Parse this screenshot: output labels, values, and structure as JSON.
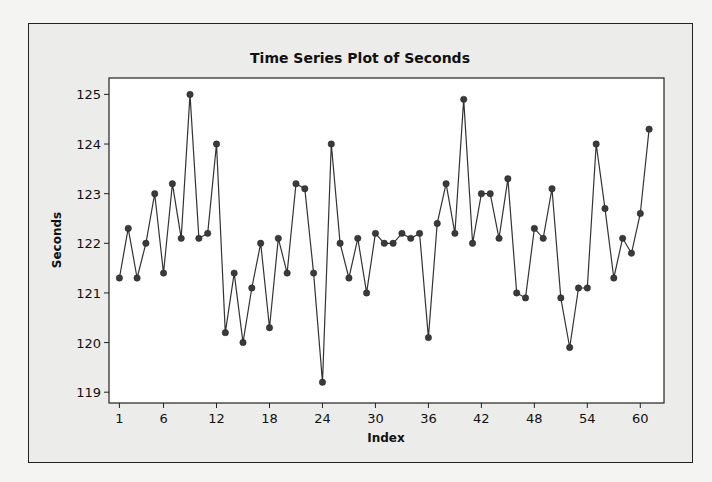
{
  "chart_data": {
    "type": "line",
    "title": "Time Series Plot of Seconds",
    "xlabel": "Index",
    "ylabel": "Seconds",
    "x_ticks": [
      1,
      6,
      12,
      18,
      24,
      30,
      36,
      42,
      48,
      54,
      60
    ],
    "y_ticks": [
      119,
      120,
      121,
      122,
      123,
      124,
      125
    ],
    "xlim": [
      1,
      61
    ],
    "ylim": [
      119,
      125
    ],
    "grid": false,
    "legend": null,
    "marker": "filled-circle",
    "series": [
      {
        "name": "Seconds",
        "x": [
          1,
          2,
          3,
          4,
          5,
          6,
          7,
          8,
          9,
          10,
          11,
          12,
          13,
          14,
          15,
          16,
          17,
          18,
          19,
          20,
          21,
          22,
          23,
          24,
          25,
          26,
          27,
          28,
          29,
          30,
          31,
          32,
          33,
          34,
          35,
          36,
          37,
          38,
          39,
          40,
          41,
          42,
          43,
          44,
          45,
          46,
          47,
          48,
          49,
          50,
          51,
          52,
          53,
          54,
          55,
          56,
          57,
          58,
          59,
          60,
          61
        ],
        "values": [
          121.3,
          122.3,
          121.3,
          122.0,
          123.0,
          121.4,
          123.2,
          122.1,
          125.0,
          122.1,
          122.2,
          124.0,
          120.2,
          121.4,
          120.0,
          121.1,
          122.0,
          120.3,
          122.1,
          121.4,
          123.2,
          123.1,
          121.4,
          119.2,
          124.0,
          122.0,
          121.3,
          122.1,
          121.0,
          122.2,
          122.0,
          122.0,
          122.2,
          122.1,
          122.2,
          120.1,
          122.4,
          123.2,
          122.2,
          124.9,
          122.0,
          123.0,
          123.0,
          122.1,
          123.3,
          121.0,
          120.9,
          122.3,
          122.1,
          123.1,
          120.9,
          119.9,
          121.1,
          121.1,
          124.0,
          122.7,
          121.3,
          122.1,
          121.8,
          122.6,
          124.3
        ]
      }
    ]
  },
  "colors": {
    "line": "#333333",
    "marker": "#3a3a3a",
    "plot_bg": "#ffffff",
    "frame_bg": "#ececea"
  }
}
